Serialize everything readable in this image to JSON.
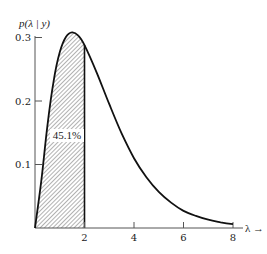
{
  "chart_data": {
    "type": "area",
    "title": "",
    "xlabel": "λ →",
    "ylabel": "p(λ | y)",
    "xlim": [
      0,
      8.3
    ],
    "ylim": [
      0,
      0.31
    ],
    "grid": false,
    "legend": null,
    "x_ticks": [
      2,
      4,
      6,
      8
    ],
    "x_tick_labels": [
      "2",
      "4",
      "6",
      "8"
    ],
    "y_ticks": [
      0.1,
      0.2,
      0.3
    ],
    "y_tick_labels": [
      "0.1",
      "0.2",
      "0.3"
    ],
    "series": [
      {
        "name": "posterior density p(λ | y)",
        "x": [
          0,
          0.25,
          0.5,
          0.75,
          1.0,
          1.25,
          1.5,
          1.75,
          2.0,
          2.5,
          3.0,
          3.5,
          4.0,
          4.5,
          5.0,
          5.5,
          6.0,
          6.5,
          7.0,
          7.5,
          8.0
        ],
        "values": [
          0,
          0.073,
          0.161,
          0.231,
          0.277,
          0.301,
          0.308,
          0.303,
          0.288,
          0.244,
          0.195,
          0.149,
          0.11,
          0.08,
          0.057,
          0.04,
          0.027,
          0.019,
          0.013,
          0.009,
          0.006
        ]
      }
    ],
    "shaded_region": {
      "from": 0,
      "to": 2,
      "pattern": "diagonal hatch",
      "label": "45.1%"
    },
    "annotations": [
      {
        "text": "45.1%",
        "x": 1.25,
        "y": 0.145
      }
    ]
  },
  "labels": {
    "ylabel": "p(λ | y)",
    "xlabel": "λ →",
    "shaded_pct": "45.1%",
    "xticks": [
      "2",
      "4",
      "6",
      "8"
    ],
    "yticks": [
      "0.1",
      "0.2",
      "0.3"
    ]
  }
}
